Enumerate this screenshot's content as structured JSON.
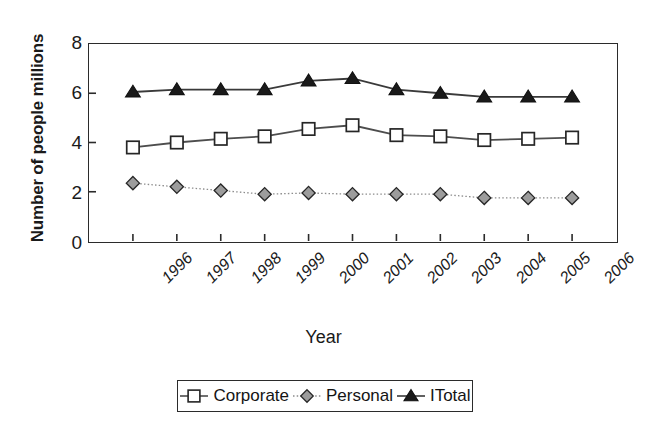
{
  "chart_data": {
    "type": "line",
    "title": "",
    "xlabel": "Year",
    "ylabel": "Number of people millions",
    "categories": [
      "1996",
      "1997",
      "1998",
      "1999",
      "2000",
      "2001",
      "2002",
      "2003",
      "2004",
      "2005",
      "2006"
    ],
    "x": [
      1996,
      1997,
      1998,
      1999,
      2000,
      2001,
      2002,
      2003,
      2004,
      2005,
      2006
    ],
    "xlim": [
      1995.5,
      2006.5
    ],
    "ylim": [
      0,
      8
    ],
    "yticks": [
      0,
      2,
      4,
      6,
      8
    ],
    "ytick_labels": [
      "0",
      "2",
      "4",
      "6",
      "8"
    ],
    "grid": false,
    "legend_position": "bottom",
    "series": [
      {
        "name": "Corporate",
        "marker": "open-square",
        "marker_fill": "#ffffff",
        "marker_stroke": "#262626",
        "line_color": "#4d4d4d",
        "line_style": "solid",
        "values": [
          3.8,
          4.0,
          4.15,
          4.25,
          4.55,
          4.7,
          4.3,
          4.25,
          4.1,
          4.15,
          4.2
        ]
      },
      {
        "name": "Personal",
        "marker": "filled-diamond",
        "marker_fill": "#9c9c9c",
        "marker_stroke": "#262626",
        "line_color": "#8c8c8c",
        "line_style": "dotted",
        "values": [
          2.35,
          2.2,
          2.05,
          1.9,
          1.95,
          1.9,
          1.9,
          1.9,
          1.75,
          1.75,
          1.75
        ]
      },
      {
        "name": "ITotal",
        "marker": "filled-triangle",
        "marker_fill": "#1a1a1a",
        "marker_stroke": "#111111",
        "line_color": "#3a3a3a",
        "line_style": "solid",
        "values": [
          6.05,
          6.15,
          6.15,
          6.15,
          6.5,
          6.6,
          6.15,
          6.0,
          5.85,
          5.85,
          5.85
        ]
      }
    ]
  },
  "legend": {
    "entries": [
      {
        "label": "Corporate",
        "marker": "open-square"
      },
      {
        "label": "Personal",
        "marker": "filled-diamond"
      },
      {
        "label": "ITotal",
        "marker": "filled-triangle"
      }
    ]
  },
  "axes": {
    "y_title": "Number of people millions",
    "x_title": "Year"
  },
  "colors": {
    "axis": "#2b2b2b",
    "text": "#1a1a1a",
    "background": "#ffffff",
    "corporate_line": "#4d4d4d",
    "personal_line": "#8c8c8c",
    "total_line": "#3a3a3a",
    "personal_marker_fill": "#9c9c9c",
    "total_marker_fill": "#1a1a1a"
  }
}
